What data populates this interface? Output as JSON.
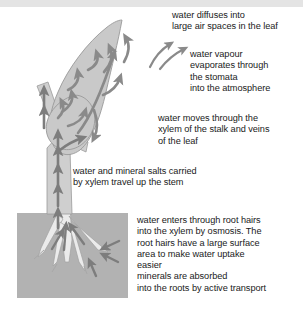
{
  "figure": {
    "colors": {
      "leaf_fill": "#c9c9c9",
      "leaf_stroke": "#9a9a9a",
      "stem_fill": "#cfcfcf",
      "stem_stroke": "#9a9a9a",
      "soil_fill": "#b2b2b2",
      "root_fill": "#e8e8e8",
      "root_stroke": "#9c9c9c",
      "arrow": "#8a8a8a",
      "text": "#1a1a1a",
      "top_strip": "#e4e4e4",
      "background": "#ffffff"
    }
  },
  "labels": {
    "diffuses": "water diffuses into\nlarge air spaces in the leaf",
    "vapour": "water vapour\nevaporates through\nthe stomata\ninto the atmosphere",
    "moves": "water moves through the\nxylem of the stalk and veins\nof the leaf",
    "salts": "water and mineral salts carried\nby xylem travel up the stem",
    "roothairs": "water enters through root hairs\ninto the xylem by osmosis. The\nroot hairs have a large surface\narea to make water uptake\neasier\nminerals are absorbed\ninto the roots by active transport"
  },
  "parts": {
    "leaf": "leaf-blade",
    "stem": "stem-stalk",
    "soil": "soil-block",
    "roots": "root-system",
    "leaf_arrows": "water-flow-arrows-in-leaf",
    "stem_arrows": "water-flow-arrows-in-stem",
    "root_arrows": "water-uptake-arrows-in-roots",
    "stomata_arrows": "water-vapour-escape-arrows"
  }
}
